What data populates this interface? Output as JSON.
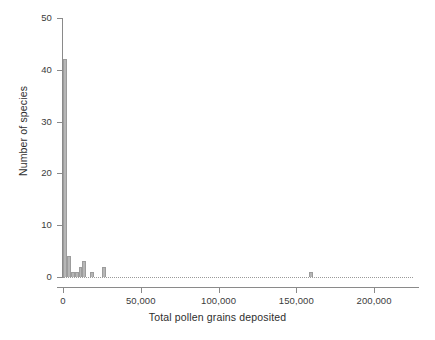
{
  "chart_data": {
    "type": "bar",
    "title": "",
    "subtitle": "",
    "xlabel": "Total pollen grains deposited",
    "ylabel": "Number of species",
    "xlim": [
      0,
      225000
    ],
    "ylim": [
      0,
      50
    ],
    "grid": "dotted-zero-line",
    "legend": "none",
    "bin_width": 2500,
    "xticks": [
      0,
      50000,
      100000,
      150000,
      200000
    ],
    "xtick_labels": [
      "0",
      "50,000",
      "100,000",
      "150,000",
      "200,000"
    ],
    "yticks": [
      0,
      10,
      20,
      30,
      40,
      50
    ],
    "ytick_labels": [
      "0",
      "10",
      "20",
      "30",
      "40",
      "50"
    ],
    "bar_color": "#b6b6b6",
    "bar_edge_color": "#9c9c9c",
    "axis_color": "#8a8a8a",
    "text_color": "#2e2e2e",
    "bins": [
      {
        "x_start": 0,
        "x_end": 2500,
        "value": 42
      },
      {
        "x_start": 2500,
        "x_end": 5000,
        "value": 4
      },
      {
        "x_start": 5000,
        "x_end": 7500,
        "value": 1
      },
      {
        "x_start": 7500,
        "x_end": 10000,
        "value": 1
      },
      {
        "x_start": 10000,
        "x_end": 12500,
        "value": 2
      },
      {
        "x_start": 12500,
        "x_end": 15000,
        "value": 3
      },
      {
        "x_start": 17500,
        "x_end": 20000,
        "value": 1
      },
      {
        "x_start": 25000,
        "x_end": 27500,
        "value": 2
      },
      {
        "x_start": 158000,
        "x_end": 160500,
        "value": 1
      }
    ],
    "values": [
      42,
      4,
      1,
      1,
      2,
      3,
      1,
      2,
      1
    ],
    "categories": [
      "0-2,500",
      "2,500-5,000",
      "5,000-7,500",
      "7,500-10,000",
      "10,000-12,500",
      "12,500-15,000",
      "17,500-20,000",
      "25,000-27,500",
      "158,000-160,500"
    ]
  }
}
